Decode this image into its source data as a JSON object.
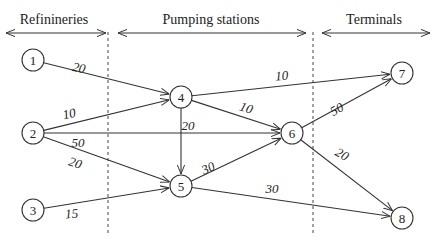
{
  "sections": [
    {
      "label": "Refinineries",
      "x1": 6,
      "x2": 106,
      "text_x": 54
    },
    {
      "label": "Pumping stations",
      "x1": 118,
      "x2": 306,
      "text_x": 211
    },
    {
      "label": "Terminals",
      "x1": 322,
      "x2": 430,
      "text_x": 374
    }
  ],
  "dividers": [
    108,
    313
  ],
  "nodes": [
    {
      "id": "1",
      "x": 33,
      "y": 60
    },
    {
      "id": "2",
      "x": 33,
      "y": 133
    },
    {
      "id": "3",
      "x": 33,
      "y": 210
    },
    {
      "id": "4",
      "x": 181,
      "y": 97
    },
    {
      "id": "5",
      "x": 181,
      "y": 186
    },
    {
      "id": "6",
      "x": 292,
      "y": 133
    },
    {
      "id": "7",
      "x": 402,
      "y": 73
    },
    {
      "id": "8",
      "x": 402,
      "y": 218
    }
  ],
  "edges": [
    {
      "from": "1",
      "to": "4",
      "label": "20",
      "lx": 78,
      "ly": 72,
      "rot": 12
    },
    {
      "from": "2",
      "to": "4",
      "label": "10",
      "lx": 70,
      "ly": 118,
      "rot": -12
    },
    {
      "from": "2",
      "to": "6",
      "label": "50",
      "lx": 78,
      "ly": 147,
      "rot": 0
    },
    {
      "from": "2",
      "to": "5",
      "label": "20",
      "lx": 74,
      "ly": 167,
      "rot": 18
    },
    {
      "from": "3",
      "to": "5",
      "label": "15",
      "lx": 72,
      "ly": 218,
      "rot": -5
    },
    {
      "from": "4",
      "to": "7",
      "label": "10",
      "lx": 282,
      "ly": 80,
      "rot": -4
    },
    {
      "from": "4",
      "to": "6",
      "label": "10",
      "lx": 245,
      "ly": 112,
      "rot": 18
    },
    {
      "from": "4",
      "to": "5",
      "label": "20",
      "lx": 188,
      "ly": 130,
      "rot": 0
    },
    {
      "from": "5",
      "to": "6",
      "label": "30",
      "lx": 210,
      "ly": 172,
      "rot": -25
    },
    {
      "from": "5",
      "to": "8",
      "label": "30",
      "lx": 272,
      "ly": 193,
      "rot": 0
    },
    {
      "from": "6",
      "to": "7",
      "label": "50",
      "lx": 339,
      "ly": 113,
      "rot": -30
    },
    {
      "from": "6",
      "to": "8",
      "label": "20",
      "lx": 340,
      "ly": 158,
      "rot": 30
    }
  ]
}
